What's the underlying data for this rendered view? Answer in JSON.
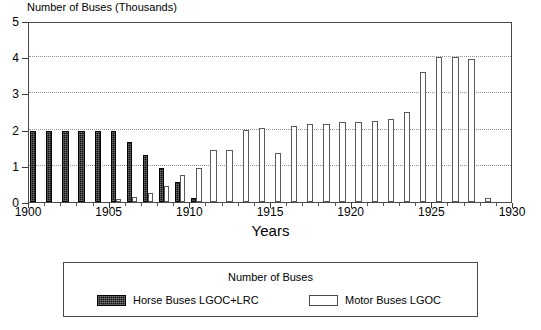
{
  "chart_data": {
    "type": "bar",
    "title": "Number of Buses (Thousands)",
    "xlabel": "Years",
    "ylabel": "Number of Buses (Thousands)",
    "xlim": [
      1900,
      1930
    ],
    "ylim": [
      0,
      5
    ],
    "grid": true,
    "grid_values": [
      1,
      2,
      3,
      4
    ],
    "legend_position": "below-plot",
    "legend_title": "Number of Buses",
    "x_tick_labels": [
      "1900",
      "1905",
      "1910",
      "1915",
      "1920",
      "1925",
      "1930"
    ],
    "x_tick_values": [
      1900,
      1905,
      1910,
      1915,
      1920,
      1925,
      1930
    ],
    "y_tick_labels": [
      "0",
      "1",
      "2",
      "3",
      "4",
      "5"
    ],
    "y_tick_values": [
      0,
      1,
      2,
      3,
      4,
      5
    ],
    "categories": [
      1900,
      1901,
      1902,
      1903,
      1904,
      1905,
      1906,
      1907,
      1908,
      1909,
      1910,
      1911,
      1912,
      1913,
      1914,
      1915,
      1916,
      1917,
      1918,
      1919,
      1920,
      1921,
      1922,
      1923,
      1924,
      1925,
      1926,
      1927,
      1928
    ],
    "series": [
      {
        "name": "Horse Buses LGOC+LRC",
        "color": "#111111",
        "values": [
          1.95,
          1.95,
          1.95,
          1.95,
          1.95,
          1.95,
          1.65,
          1.3,
          0.95,
          0.55,
          0.1,
          0,
          0,
          0,
          0,
          0,
          0,
          0,
          0,
          0,
          0,
          0,
          0,
          0,
          0,
          0,
          0,
          0,
          0
        ]
      },
      {
        "name": "Motor Buses LGOC",
        "color": "#ffffff",
        "values": [
          0,
          0,
          0,
          0,
          0,
          0.08,
          0.15,
          0.25,
          0.45,
          0.75,
          0.95,
          1.45,
          1.45,
          2.0,
          2.05,
          1.35,
          2.1,
          2.15,
          2.15,
          2.2,
          2.2,
          2.25,
          2.3,
          2.5,
          3.6,
          4.0,
          4.0,
          3.95,
          0.1
        ]
      }
    ]
  },
  "axis": {
    "x_title": "Years",
    "y_caption": "Number of Buses (Thousands)"
  },
  "legend": {
    "title": "Number of Buses",
    "entries": [
      {
        "label": "Horse Buses LGOC+LRC",
        "swatch": "dark-hatched"
      },
      {
        "label": "Motor Buses LGOC",
        "swatch": "white-outlined"
      }
    ]
  }
}
